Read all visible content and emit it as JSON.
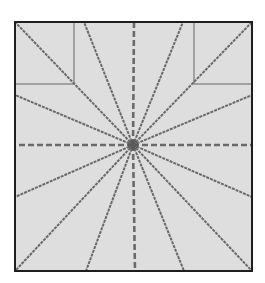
{
  "diagram": {
    "colors": {
      "background": "#ffffff",
      "panel_fill": "#dedede",
      "frame": "#1e1e1e",
      "ray": "#6a6a6a",
      "inner_rect": "#7a7a7a",
      "hub": "#555555"
    },
    "frame": {
      "x": 15,
      "y": 22,
      "width": 237,
      "height": 249
    },
    "center": {
      "x": 133,
      "y": 145
    },
    "corner_rects": [
      {
        "name": "top-left",
        "x": 15,
        "y": 22,
        "width": 59,
        "height": 62
      },
      {
        "name": "top-right",
        "x": 194,
        "y": 22,
        "width": 58,
        "height": 62
      }
    ],
    "rays": [
      {
        "x": 15,
        "y": 22,
        "dashed": false
      },
      {
        "x": 84,
        "y": 22,
        "dashed": false
      },
      {
        "x": 134,
        "y": 22,
        "dashed": true
      },
      {
        "x": 183,
        "y": 22,
        "dashed": false
      },
      {
        "x": 252,
        "y": 22,
        "dashed": false
      },
      {
        "x": 252,
        "y": 95,
        "dashed": false
      },
      {
        "x": 252,
        "y": 145,
        "dashed": true
      },
      {
        "x": 252,
        "y": 197,
        "dashed": false
      },
      {
        "x": 252,
        "y": 271,
        "dashed": false
      },
      {
        "x": 184,
        "y": 271,
        "dashed": false
      },
      {
        "x": 135,
        "y": 271,
        "dashed": true
      },
      {
        "x": 86,
        "y": 271,
        "dashed": false
      },
      {
        "x": 15,
        "y": 271,
        "dashed": false
      },
      {
        "x": 15,
        "y": 197,
        "dashed": false
      },
      {
        "x": 15,
        "y": 145,
        "dashed": true
      },
      {
        "x": 15,
        "y": 95,
        "dashed": false
      }
    ]
  }
}
